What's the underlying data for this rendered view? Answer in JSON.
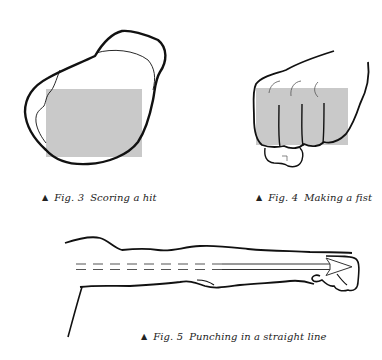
{
  "figures": [
    {
      "id": "fig3",
      "marker": "▲",
      "number": "Fig. 3",
      "title": "Scoring a hit"
    },
    {
      "id": "fig4",
      "marker": "▲",
      "number": "Fig. 4",
      "title": "Making a fist"
    },
    {
      "id": "fig5",
      "marker": "▲",
      "number": "Fig. 5",
      "title": "Punching in a straight line"
    }
  ],
  "colors": {
    "outline": "#111111",
    "highlight": "#c9c9c9"
  }
}
